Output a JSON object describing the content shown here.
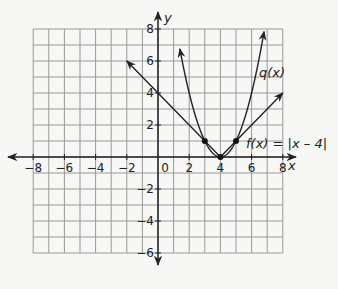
{
  "chart_data": {
    "type": "line",
    "title": "",
    "xlabel": "x",
    "ylabel": "y",
    "xlim": [
      -8,
      8
    ],
    "ylim": [
      -6,
      8
    ],
    "grid": true,
    "x_ticks": [
      "-8",
      "-6",
      "-4",
      "-2",
      "0",
      "2",
      "4",
      "6",
      "8"
    ],
    "y_ticks": [
      "8",
      "6",
      "4",
      "2",
      "-2",
      "-4",
      "-6"
    ],
    "series": [
      {
        "name": "f(x) = |x – 4|",
        "label": "f(x) = |x – 4|",
        "points": [
          [
            -2,
            6
          ],
          [
            4,
            0
          ],
          [
            8,
            4
          ]
        ],
        "arrows": "both"
      },
      {
        "name": "q(x)",
        "label": "q(x)",
        "formula": "(x-4)^2",
        "x_range": [
          1.4,
          6.8
        ],
        "arrows": "both"
      }
    ],
    "marked_points": [
      [
        3,
        1
      ],
      [
        4,
        0
      ],
      [
        5,
        1
      ]
    ],
    "annotations": [
      {
        "text": "q(x)",
        "x": 6.9,
        "y": 5.3
      },
      {
        "text": "f(x) = |x – 4|",
        "x": 5.7,
        "y": 0.9
      }
    ]
  },
  "labels": {
    "x_axis": "x",
    "y_axis": "y",
    "origin": "0",
    "q_label": "q(x)",
    "f_label": "f(x) = |x – 4|"
  }
}
